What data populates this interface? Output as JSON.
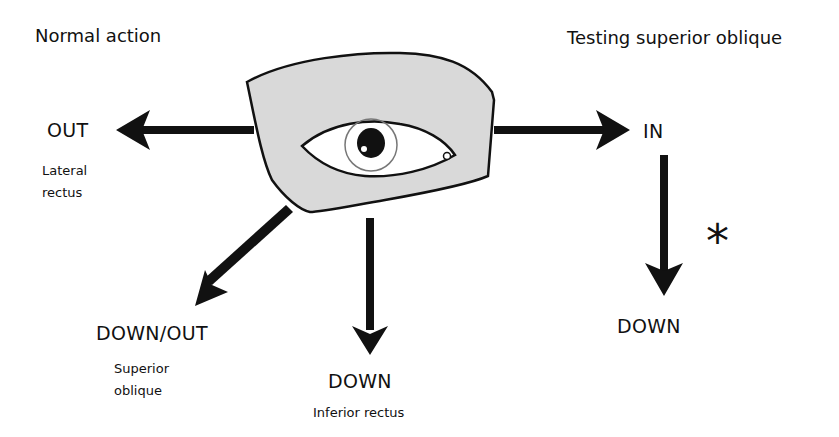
{
  "headings": {
    "left": "Normal action",
    "right": "Testing superior oblique"
  },
  "directions": {
    "out": {
      "label": "OUT",
      "muscle_line1": "Lateral",
      "muscle_line2": "rectus"
    },
    "down_out": {
      "label": "DOWN/OUT",
      "muscle_line1": "Superior",
      "muscle_line2": "oblique"
    },
    "down": {
      "label": "DOWN",
      "muscle": "Inferior rectus"
    },
    "in": {
      "label": "IN"
    },
    "test_down": {
      "label": "DOWN"
    }
  },
  "marker": "*",
  "colors": {
    "eye_socket_fill": "#d9d9d9",
    "outline": "#111111",
    "arrow": "#111111",
    "sclera": "#ffffff",
    "iris_ring": "#777777",
    "pupil": "#111111"
  },
  "icons": {
    "eye": "eye-diagram",
    "arrows": [
      "arrow-left",
      "arrow-down-left",
      "arrow-down",
      "arrow-right",
      "arrow-down"
    ]
  }
}
